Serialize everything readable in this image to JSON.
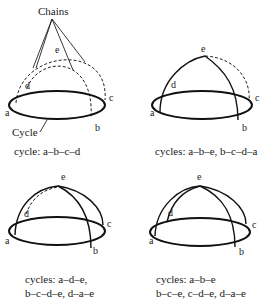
{
  "figure": {
    "panels": [
      {
        "id": "panel-1",
        "annotations": {
          "chains": "Chains",
          "cycle": "Cycle"
        },
        "vertices": {
          "a": "a",
          "b": "b",
          "c": "c",
          "d": "d",
          "e": "e"
        },
        "caption_lines": [
          "cycle: a–b–c–d"
        ]
      },
      {
        "id": "panel-2",
        "vertices": {
          "a": "a",
          "b": "b",
          "c": "c",
          "d": "d",
          "e": "e"
        },
        "caption_lines": [
          "cycles: a–b–e, b–c–d–a"
        ]
      },
      {
        "id": "panel-3",
        "vertices": {
          "a": "a",
          "b": "b",
          "c": "c",
          "d": "d",
          "e": "e"
        },
        "caption_lines": [
          "cycles: a–d–e,",
          "b–c–d–e, d–a–e"
        ]
      },
      {
        "id": "panel-4",
        "vertices": {
          "a": "a",
          "b": "b",
          "c": "c",
          "d": "d",
          "e": "e"
        },
        "caption_lines": [
          "cycles: a–b–e",
          "b–c–e, c–d–e, d–a–e"
        ]
      }
    ]
  }
}
